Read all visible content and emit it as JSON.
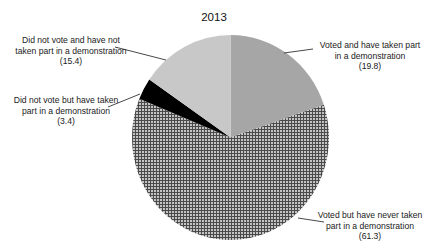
{
  "chart_data": {
    "type": "pie",
    "title": "2013",
    "start_angle": "12 o'clock",
    "direction": "clockwise",
    "slices": [
      {
        "label": "Voted and have taken part in a demonstration",
        "value": 19.8,
        "value_text": "(19.8)",
        "fill": "#a6a6a6",
        "pattern": "solid"
      },
      {
        "label": "Voted but have never taken part in a demonstration",
        "value": 61.3,
        "value_text": "(61.3)",
        "fill": "#b8b8b8",
        "pattern": "grid"
      },
      {
        "label": "Did not vote but have taken part in a demonstration",
        "value": 3.4,
        "value_text": "(3.4)",
        "fill": "#000000",
        "pattern": "solid"
      },
      {
        "label": "Did not vote and have not taken part in a demonstration",
        "value": 15.4,
        "value_text": "(15.4)",
        "fill": "#c8c8c8",
        "pattern": "solid"
      }
    ],
    "legend": "none (callout labels)"
  },
  "labels": {
    "voted_demo": {
      "line1": "Voted and have taken part",
      "line2": "in a demonstration",
      "line3": "(19.8)"
    },
    "voted_never": {
      "line1": "Voted but have never taken",
      "line2": "part in a demonstration",
      "line3": "(61.3)"
    },
    "novote_demo": {
      "line1": "Did not vote but have taken",
      "line2": "part in a demonstration",
      "line3": "(3.4)"
    },
    "novote_nodemo": {
      "line1": "Did not vote and have not",
      "line2": "taken part in a demonstration",
      "line3": "(15.4)"
    }
  }
}
